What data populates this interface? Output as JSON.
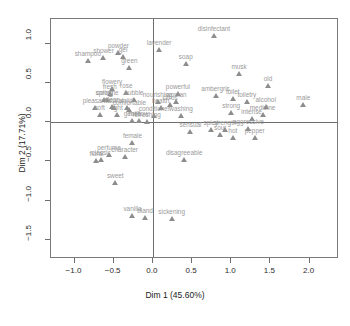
{
  "chart_data": {
    "type": "scatter",
    "title": "",
    "xlabel": "Dim 1 (45.60%)",
    "ylabel": "Dim 2 (17.71%)",
    "xlim": [
      -1.3,
      2.35
    ],
    "ylim": [
      -1.72,
      1.32
    ],
    "grid": false,
    "legend": null,
    "xticks": [
      "-1.0",
      "-0.5",
      "0.0",
      "0.5",
      "1.0",
      "1.5",
      "2.0"
    ],
    "xtickvals": [
      -1.0,
      -0.5,
      0.0,
      0.5,
      1.0,
      1.5,
      2.0
    ],
    "yticks": [
      "1.0",
      "0.5",
      "0.0",
      "-0.5",
      "-1.0",
      "-1.5"
    ],
    "ytickvals": [
      1.0,
      0.5,
      0.0,
      -0.5,
      -1.0,
      -1.5
    ],
    "marker": "triangle",
    "marker_color": "#8d8d8d",
    "label_color": "#9a9a9a",
    "axis_color": "#6e6e6e",
    "points": [
      {
        "label": "lavender",
        "x": 0.08,
        "y": 0.92
      },
      {
        "label": "powder",
        "x": -0.44,
        "y": 0.88
      },
      {
        "label": "shower",
        "x": -0.63,
        "y": 0.82
      },
      {
        "label": "gel",
        "x": -0.38,
        "y": 0.84
      },
      {
        "label": "shampoo",
        "x": -0.83,
        "y": 0.78
      },
      {
        "label": "soap",
        "x": 0.42,
        "y": 0.74
      },
      {
        "label": "green",
        "x": -0.3,
        "y": 0.7
      },
      {
        "label": "disinfectant",
        "x": 0.78,
        "y": 1.1
      },
      {
        "label": "musk",
        "x": 1.1,
        "y": 0.62
      },
      {
        "label": "old",
        "x": 1.47,
        "y": 0.46
      },
      {
        "label": "flowery",
        "x": -0.52,
        "y": 0.42
      },
      {
        "label": "fresh",
        "x": -0.55,
        "y": 0.36
      },
      {
        "label": "rose",
        "x": -0.34,
        "y": 0.37
      },
      {
        "label": "ambergris",
        "x": 0.8,
        "y": 0.34
      },
      {
        "label": "toilet",
        "x": 1.02,
        "y": 0.3
      },
      {
        "label": "powerful",
        "x": 0.32,
        "y": 0.36
      },
      {
        "label": "toiletry",
        "x": 1.2,
        "y": 0.26
      },
      {
        "label": "cologne",
        "x": -0.58,
        "y": 0.28
      },
      {
        "label": "spring",
        "x": -0.62,
        "y": 0.28
      },
      {
        "label": "bubble",
        "x": -0.24,
        "y": 0.28
      },
      {
        "label": "woman",
        "x": 0.3,
        "y": 0.26
      },
      {
        "label": "nourishing",
        "x": 0.06,
        "y": 0.26
      },
      {
        "label": "male",
        "x": 1.92,
        "y": 0.22
      },
      {
        "label": "alcohol",
        "x": 1.44,
        "y": 0.2
      },
      {
        "label": "citrus",
        "x": 0.22,
        "y": 0.22
      },
      {
        "label": "clean",
        "x": -0.52,
        "y": 0.2
      },
      {
        "label": "pleasant",
        "x": -0.74,
        "y": 0.18
      },
      {
        "label": "natural",
        "x": -0.5,
        "y": 0.18
      },
      {
        "label": "mild",
        "x": -0.33,
        "y": 0.18
      },
      {
        "label": "health",
        "x": 0.1,
        "y": 0.18
      },
      {
        "label": "comfortable",
        "x": -0.3,
        "y": 0.16
      },
      {
        "label": "soft",
        "x": -0.68,
        "y": 0.1
      },
      {
        "label": "light",
        "x": -0.46,
        "y": 0.1
      },
      {
        "label": "conditioner",
        "x": 0.02,
        "y": 0.08
      },
      {
        "label": "washing",
        "x": 0.36,
        "y": 0.08
      },
      {
        "label": "strong",
        "x": 1.0,
        "y": 0.12
      },
      {
        "label": "intense",
        "x": 1.26,
        "y": 0.04
      },
      {
        "label": "medicine",
        "x": 1.4,
        "y": 0.1
      },
      {
        "label": "gentle",
        "x": -0.26,
        "y": 0.02
      },
      {
        "label": "mellow",
        "x": -0.18,
        "y": 0.02
      },
      {
        "label": "refreshing",
        "x": -0.08,
        "y": 0.0
      },
      {
        "label": "aggressive",
        "x": 1.22,
        "y": -0.08
      },
      {
        "label": "strength",
        "x": 0.92,
        "y": -0.1
      },
      {
        "label": "spicy",
        "x": 0.74,
        "y": -0.1
      },
      {
        "label": "sensual",
        "x": 0.48,
        "y": -0.12
      },
      {
        "label": "sour",
        "x": 0.86,
        "y": -0.16
      },
      {
        "label": "hot",
        "x": 1.02,
        "y": -0.2
      },
      {
        "label": "pepper",
        "x": 1.3,
        "y": -0.2
      },
      {
        "label": "female",
        "x": -0.26,
        "y": -0.26
      },
      {
        "label": "perfume",
        "x": -0.56,
        "y": -0.42
      },
      {
        "label": "character",
        "x": -0.36,
        "y": -0.44
      },
      {
        "label": "classic",
        "x": -0.66,
        "y": -0.48
      },
      {
        "label": "floral",
        "x": -0.72,
        "y": -0.5
      },
      {
        "label": "disagreeable",
        "x": 0.4,
        "y": -0.48
      },
      {
        "label": "sweet",
        "x": -0.48,
        "y": -0.78
      },
      {
        "label": "vanilla",
        "x": -0.26,
        "y": -1.2
      },
      {
        "label": "bland",
        "x": -0.1,
        "y": -1.22
      },
      {
        "label": "sickening",
        "x": 0.24,
        "y": -1.24
      }
    ]
  }
}
